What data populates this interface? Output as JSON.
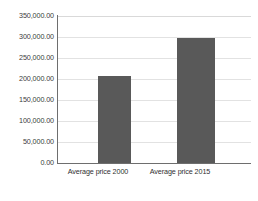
{
  "chart_data": {
    "type": "bar",
    "title": "",
    "subtitle": "",
    "xlabel": "",
    "ylabel": "",
    "categories": [
      "Average price 2000",
      "Average price 2015"
    ],
    "values": [
      208000,
      298000
    ],
    "series": [
      {
        "name": "Average price",
        "values": [
          208000,
          298000
        ]
      }
    ],
    "ylim": [
      0,
      350000
    ],
    "ytick_labels": [
      "0.00",
      "50,000.00",
      "100,000.00",
      "150,000.00",
      "200,000.00",
      "250,000.00",
      "300,000.00",
      "350,000.00"
    ],
    "ytick_values": [
      0,
      50000,
      100000,
      150000,
      200000,
      250000,
      300000,
      350000
    ],
    "grid": true,
    "grid_axis": "y",
    "legend": false,
    "legend_position": "none",
    "bar_color": "#595959",
    "gridline_color": "#e2e2e2",
    "axis_color": "#6e6e6e",
    "background_color": "#ffffff",
    "annotations": []
  }
}
